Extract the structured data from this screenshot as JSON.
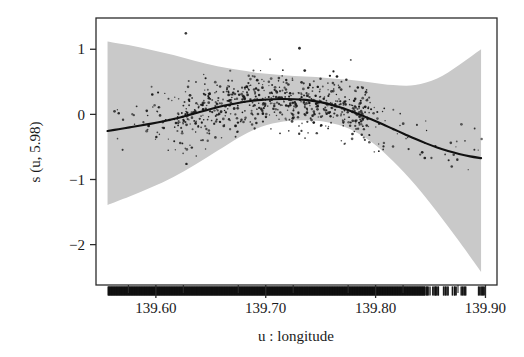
{
  "figure": {
    "background_color": "#ffffff",
    "frame_color": "#2b2b2b",
    "band_color": "#c9c9c9",
    "curve_color": "#111111",
    "point_color": "#171717",
    "rug_color": "#0d0d0d"
  },
  "chart_data": {
    "type": "line",
    "title": "",
    "subtitle": "",
    "xlabel": "u : longitude",
    "ylabel": "s (u, 5.98)",
    "xlim": [
      139.5455,
      139.9105
    ],
    "ylim": [
      -2.62,
      1.48
    ],
    "grid": false,
    "legend": null,
    "x_ticks": [
      139.6,
      139.7,
      139.8,
      139.9
    ],
    "x_tick_labels": [
      "139.60",
      "139.70",
      "139.80",
      "139.90"
    ],
    "x_minor_ticks": [
      139.575,
      139.625,
      139.675,
      139.725,
      139.775,
      139.825,
      139.875
    ],
    "y_ticks": [
      1,
      0,
      -1,
      -2
    ],
    "y_tick_labels": [
      "1",
      "0",
      "-1",
      "-2"
    ],
    "series": [
      {
        "name": "smooth-fit",
        "type": "line",
        "x": [
          139.556,
          139.566,
          139.576,
          139.586,
          139.596,
          139.606,
          139.616,
          139.626,
          139.636,
          139.646,
          139.656,
          139.666,
          139.676,
          139.686,
          139.696,
          139.706,
          139.716,
          139.726,
          139.736,
          139.746,
          139.756,
          139.766,
          139.776,
          139.786,
          139.796,
          139.806,
          139.816,
          139.826,
          139.836,
          139.846,
          139.856,
          139.866,
          139.876,
          139.886,
          139.896
        ],
        "values": [
          -0.255,
          -0.228,
          -0.2,
          -0.172,
          -0.142,
          -0.108,
          -0.07,
          -0.028,
          0.018,
          0.065,
          0.108,
          0.147,
          0.18,
          0.205,
          0.222,
          0.232,
          0.236,
          0.233,
          0.222,
          0.2,
          0.165,
          0.118,
          0.06,
          -0.005,
          -0.075,
          -0.148,
          -0.225,
          -0.3,
          -0.375,
          -0.445,
          -0.508,
          -0.562,
          -0.608,
          -0.645,
          -0.672
        ]
      },
      {
        "name": "confidence-band-upper",
        "type": "area-edge",
        "x": [
          139.556,
          139.576,
          139.596,
          139.616,
          139.636,
          139.656,
          139.676,
          139.696,
          139.716,
          139.736,
          139.756,
          139.776,
          139.796,
          139.816,
          139.836,
          139.856,
          139.876,
          139.896
        ],
        "values": [
          1.12,
          1.06,
          0.99,
          0.91,
          0.82,
          0.74,
          0.68,
          0.63,
          0.6,
          0.58,
          0.56,
          0.53,
          0.49,
          0.45,
          0.45,
          0.55,
          0.76,
          1.0
        ]
      },
      {
        "name": "confidence-band-lower",
        "type": "area-edge",
        "x": [
          139.556,
          139.576,
          139.596,
          139.616,
          139.636,
          139.656,
          139.676,
          139.696,
          139.716,
          139.736,
          139.756,
          139.776,
          139.796,
          139.816,
          139.836,
          139.856,
          139.876,
          139.896
        ],
        "values": [
          -1.39,
          -1.26,
          -1.12,
          -0.96,
          -0.77,
          -0.56,
          -0.35,
          -0.19,
          -0.11,
          -0.09,
          -0.12,
          -0.22,
          -0.42,
          -0.72,
          -1.08,
          -1.5,
          -1.95,
          -2.42
        ]
      },
      {
        "name": "partial-residual-points",
        "type": "scatter",
        "n_points": 760,
        "note": "dense black scatter of partial residuals around the fitted curve"
      },
      {
        "name": "rug-plot",
        "type": "rug",
        "note": "dense black data-density rug along bottom axis, nearly solid from 139.555 to 139.855 with gaps near 139.86-139.90"
      }
    ]
  },
  "axes": {
    "x_label": "u : longitude",
    "y_label": "s (u, 5.98)"
  }
}
